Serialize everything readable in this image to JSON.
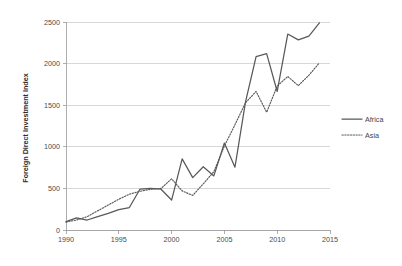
{
  "chart_data": {
    "type": "line",
    "title": "",
    "xlabel": "",
    "ylabel": "Foreign Direct Investment Index",
    "xlim": [
      1990,
      2015
    ],
    "ylim": [
      0,
      2500
    ],
    "grid": true,
    "legend_position": "right",
    "x_ticks": [
      "1990",
      "1995",
      "2000",
      "2005",
      "2010",
      "2015"
    ],
    "x_tick_values": [
      1990,
      1995,
      2000,
      2005,
      2010,
      2015
    ],
    "y_ticks": [
      "0",
      "500",
      "1000",
      "1500",
      "2000",
      "2500"
    ],
    "y_tick_values": [
      0,
      500,
      1000,
      1500,
      2000,
      2500
    ],
    "x": [
      1990,
      1991,
      1992,
      1993,
      1994,
      1995,
      1996,
      1997,
      1998,
      1999,
      2000,
      2001,
      2002,
      2003,
      2004,
      2005,
      2006,
      2007,
      2008,
      2009,
      2010,
      2011,
      2012,
      2013,
      2014
    ],
    "series": [
      {
        "name": "Africa",
        "style": "solid",
        "color": "#595959",
        "values": [
          100,
          145,
          120,
          160,
          200,
          245,
          270,
          490,
          500,
          490,
          360,
          855,
          630,
          760,
          650,
          1045,
          755,
          1540,
          2085,
          2120,
          1665,
          2355,
          2285,
          2330,
          2490
        ]
      },
      {
        "name": "Asia",
        "style": "dotted",
        "color": "#595959",
        "values": [
          95,
          120,
          160,
          230,
          300,
          370,
          430,
          465,
          490,
          500,
          615,
          470,
          415,
          555,
          700,
          1010,
          1265,
          1530,
          1665,
          1415,
          1730,
          1845,
          1735,
          1860,
          2010
        ]
      }
    ]
  },
  "legend": {
    "items": [
      {
        "label": "Africa",
        "style": "solid"
      },
      {
        "label": "Asia",
        "style": "dotted"
      }
    ]
  }
}
